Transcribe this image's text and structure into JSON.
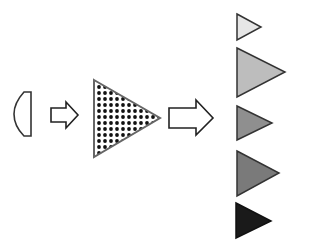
{
  "diagram": {
    "source_shape": {
      "type": "half-lens",
      "stroke": "#333333"
    },
    "arrows": [
      {
        "id": "arrow-1",
        "fill": "#ffffff",
        "stroke": "#222222"
      },
      {
        "id": "arrow-2",
        "fill": "#ffffff",
        "stroke": "#222222"
      }
    ],
    "pattern_triangle": {
      "fill_pattern": "dots",
      "dot_color": "#111111",
      "stroke": "#666666"
    },
    "output_triangles": [
      {
        "id": "tri-1",
        "fill": "#e6e6e6",
        "stroke": "#333333"
      },
      {
        "id": "tri-2",
        "fill": "#bdbdbd",
        "stroke": "#333333"
      },
      {
        "id": "tri-3",
        "fill": "#8f8f8f",
        "stroke": "#333333"
      },
      {
        "id": "tri-4",
        "fill": "#7a7a7a",
        "stroke": "#333333"
      },
      {
        "id": "tri-5",
        "fill": "#1a1a1a",
        "stroke": "#111111"
      }
    ]
  }
}
